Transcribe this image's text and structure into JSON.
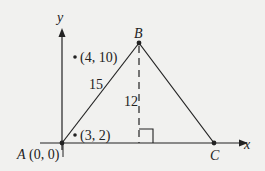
{
  "diagram": {
    "axes": {
      "x_label": "x",
      "y_label": "y"
    },
    "vertices": {
      "A": {
        "name": "A",
        "coord_label": "(0, 0)"
      },
      "B": {
        "name": "B"
      },
      "C": {
        "name": "C"
      }
    },
    "segments": {
      "AB_length": "15",
      "altitude_length": "12"
    },
    "points": [
      {
        "label": "(4, 10)"
      },
      {
        "label": "(3, 2)"
      }
    ],
    "colors": {
      "background": "#f1f1ef",
      "ink": "#222222"
    }
  }
}
